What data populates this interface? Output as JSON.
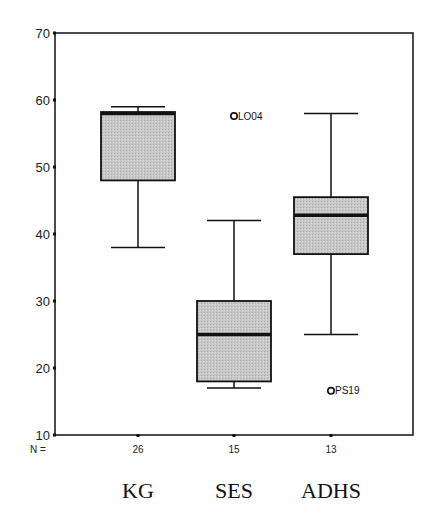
{
  "chart_data": {
    "type": "boxplot",
    "title": "",
    "xlabel": "",
    "ylabel": "",
    "ylim": [
      10,
      70
    ],
    "yticks": [
      10,
      20,
      30,
      40,
      50,
      60,
      70
    ],
    "grid": false,
    "legend": null,
    "n_prefix": "N =",
    "categories": [
      "KG",
      "SES",
      "ADHS"
    ],
    "series": [
      {
        "name": "KG",
        "n": 26,
        "whisker_low": 38,
        "q1": 48,
        "median": 58,
        "q3": 58.2,
        "whisker_high": 59,
        "outliers": []
      },
      {
        "name": "SES",
        "n": 15,
        "whisker_low": 17,
        "q1": 18,
        "median": 25,
        "q3": 30,
        "whisker_high": 42,
        "outliers": [
          {
            "label": "LO04",
            "value": 57.6
          }
        ]
      },
      {
        "name": "ADHS",
        "n": 13,
        "whisker_low": 25,
        "q1": 37,
        "median": 42.8,
        "q3": 45.5,
        "whisker_high": 58,
        "outliers": [
          {
            "label": "PS19",
            "value": 16.6
          }
        ]
      }
    ],
    "colors": {
      "box_fill": "#c8c8c8",
      "line": "#111111",
      "axis": "#111111"
    }
  }
}
